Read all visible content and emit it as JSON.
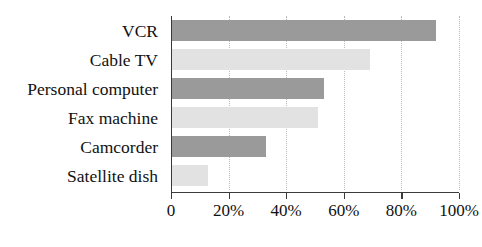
{
  "chart_data": {
    "type": "bar",
    "orientation": "horizontal",
    "title": "",
    "xlabel": "",
    "ylabel": "",
    "categories": [
      "VCR",
      "Cable TV",
      "Personal computer",
      "Fax machine",
      "Camcorder",
      "Satellite dish"
    ],
    "values": [
      92,
      69,
      53,
      51,
      33,
      13
    ],
    "value_suffix": "%",
    "xlim": [
      0,
      100
    ],
    "xticks": [
      0,
      20,
      40,
      60,
      80,
      100
    ],
    "xtick_labels": [
      "0",
      "20%",
      "40%",
      "60%",
      "80%",
      "100%"
    ],
    "grid": "vertical-dotted",
    "legend": "none",
    "bar_colors": [
      "#9a9a9a",
      "#e2e2e2",
      "#9a9a9a",
      "#e2e2e2",
      "#9a9a9a",
      "#e2e2e2"
    ],
    "axis_color": "#3a3a3a",
    "gridline_color": "#b9b9b9"
  }
}
